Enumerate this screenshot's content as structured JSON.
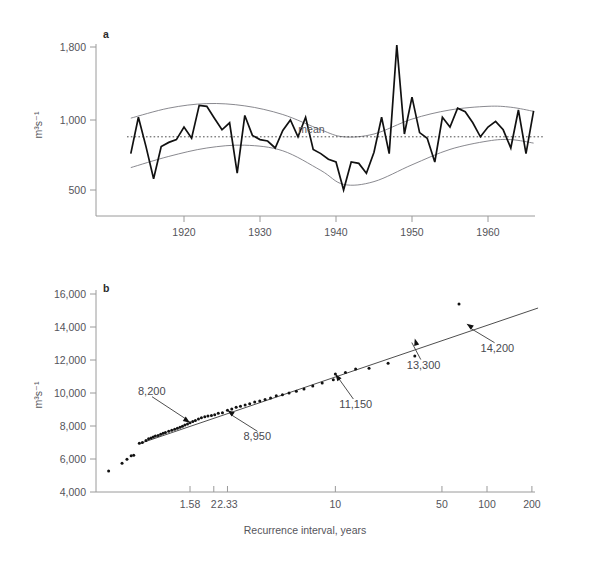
{
  "figure": {
    "panel_a_letter": "a",
    "panel_b_letter": "b"
  },
  "chart_data": [
    {
      "type": "line",
      "panel": "a",
      "title": "",
      "xlabel": "",
      "ylabel": "m3s-1",
      "ylabel_display": "m³s⁻¹",
      "xlim": [
        1912,
        1967
      ],
      "ylim": [
        330,
        1880
      ],
      "yticks": [
        500,
        1000,
        1800
      ],
      "ytick_labels": [
        "500",
        "1,000",
        "1,800"
      ],
      "xticks": [
        1920,
        1930,
        1940,
        1950,
        1960
      ],
      "xtick_labels": [
        "1920",
        "1930",
        "1940",
        "1950",
        "1960"
      ],
      "grid": false,
      "y_axis_scale": "non-linear-breaks",
      "annotations": [
        {
          "text": "mean",
          "x": 1938.5,
          "y": 880
        }
      ],
      "mean_value": 880,
      "series": [
        {
          "name": "annual discharge",
          "x": [
            1913,
            1914,
            1915,
            1916,
            1917,
            1918,
            1919,
            1920,
            1921,
            1922,
            1923,
            1924,
            1925,
            1926,
            1927,
            1928,
            1929,
            1930,
            1931,
            1932,
            1933,
            1934,
            1935,
            1936,
            1937,
            1938,
            1939,
            1940,
            1941,
            1942,
            1943,
            1944,
            1945,
            1946,
            1947,
            1948,
            1949,
            1950,
            1951,
            1952,
            1953,
            1954,
            1955,
            1956,
            1957,
            1958,
            1959,
            1960,
            1961,
            1962,
            1963,
            1964,
            1965,
            1966
          ],
          "values": [
            760,
            1030,
            810,
            580,
            810,
            840,
            860,
            950,
            870,
            1160,
            1150,
            1020,
            930,
            980,
            620,
            1050,
            890,
            860,
            850,
            800,
            925,
            1000,
            880,
            1030,
            790,
            760,
            720,
            700,
            500,
            700,
            690,
            620,
            770,
            1030,
            760,
            1820,
            900,
            1250,
            910,
            870,
            700,
            1030,
            950,
            1130,
            1090,
            980,
            880,
            950,
            990,
            930,
            800,
            1110,
            760,
            1100
          ]
        },
        {
          "name": "upper envelope",
          "x": [
            1913,
            1918,
            1923,
            1928,
            1933,
            1938,
            1941,
            1945,
            1950,
            1955,
            1960,
            1963,
            1966
          ],
          "values": [
            1020,
            1130,
            1180,
            1155,
            1060,
            930,
            880,
            900,
            1010,
            1110,
            1150,
            1140,
            1095
          ]
        },
        {
          "name": "lower envelope",
          "x": [
            1913,
            1918,
            1923,
            1928,
            1933,
            1938,
            1941,
            1945,
            1950,
            1955,
            1960,
            1963,
            1966
          ],
          "values": [
            660,
            740,
            800,
            820,
            780,
            640,
            540,
            560,
            680,
            790,
            850,
            860,
            835
          ]
        }
      ]
    },
    {
      "type": "scatter",
      "panel": "b",
      "title": "",
      "xlabel": "Recurrence interval, years",
      "ylabel": "m3s-1",
      "ylabel_display": "m³s⁻¹",
      "x_axis_scale": "log-gumbel",
      "ylim": [
        4000,
        16000
      ],
      "yticks": [
        4000,
        6000,
        8000,
        10000,
        12000,
        14000,
        16000
      ],
      "ytick_labels": [
        "4,000",
        "6,000",
        "8,000",
        "10,000",
        "12,000",
        "14,000",
        "16,000"
      ],
      "xticks": [
        1.58,
        2,
        2.33,
        10,
        50,
        100,
        200
      ],
      "xtick_labels": [
        "1.58",
        "2",
        "2.33",
        "10",
        "50",
        "100",
        "200"
      ],
      "grid": false,
      "fit_line": {
        "name": "Gumbel fit",
        "x_start": 1.13,
        "y_start": 6950,
        "x_end": 220,
        "y_end": 15150
      },
      "annotations": [
        {
          "text": "8,200",
          "value": 8200,
          "point_x": 1.58,
          "point_y": 8200
        },
        {
          "text": "8,950",
          "value": 8950,
          "point_x": 2.33,
          "point_y": 8950
        },
        {
          "text": "11,150",
          "value": 11150,
          "point_x": 10,
          "point_y": 11150
        },
        {
          "text": "13,300",
          "value": 13300,
          "point_x": 33,
          "point_y": 13300
        },
        {
          "text": "14,200",
          "value": 14200,
          "point_x": 73,
          "point_y": 14200
        }
      ],
      "points": [
        {
          "x": 1.03,
          "y": 5280
        },
        {
          "x": 1.06,
          "y": 5750
        },
        {
          "x": 1.075,
          "y": 5990
        },
        {
          "x": 1.09,
          "y": 6190
        },
        {
          "x": 1.1,
          "y": 6230
        },
        {
          "x": 1.125,
          "y": 6960
        },
        {
          "x": 1.14,
          "y": 7000
        },
        {
          "x": 1.16,
          "y": 7120
        },
        {
          "x": 1.175,
          "y": 7220
        },
        {
          "x": 1.19,
          "y": 7280
        },
        {
          "x": 1.205,
          "y": 7330
        },
        {
          "x": 1.22,
          "y": 7390
        },
        {
          "x": 1.24,
          "y": 7430
        },
        {
          "x": 1.26,
          "y": 7500
        },
        {
          "x": 1.28,
          "y": 7560
        },
        {
          "x": 1.3,
          "y": 7610
        },
        {
          "x": 1.33,
          "y": 7680
        },
        {
          "x": 1.36,
          "y": 7740
        },
        {
          "x": 1.39,
          "y": 7800
        },
        {
          "x": 1.42,
          "y": 7870
        },
        {
          "x": 1.45,
          "y": 7930
        },
        {
          "x": 1.48,
          "y": 7990
        },
        {
          "x": 1.51,
          "y": 8060
        },
        {
          "x": 1.545,
          "y": 8120
        },
        {
          "x": 1.58,
          "y": 8200
        },
        {
          "x": 1.62,
          "y": 8270
        },
        {
          "x": 1.66,
          "y": 8340
        },
        {
          "x": 1.71,
          "y": 8430
        },
        {
          "x": 1.76,
          "y": 8500
        },
        {
          "x": 1.82,
          "y": 8560
        },
        {
          "x": 1.88,
          "y": 8600
        },
        {
          "x": 1.95,
          "y": 8640
        },
        {
          "x": 2.02,
          "y": 8680
        },
        {
          "x": 2.1,
          "y": 8780
        },
        {
          "x": 2.2,
          "y": 8800
        },
        {
          "x": 2.33,
          "y": 8950
        },
        {
          "x": 2.45,
          "y": 9030
        },
        {
          "x": 2.58,
          "y": 9130
        },
        {
          "x": 2.72,
          "y": 9200
        },
        {
          "x": 2.88,
          "y": 9280
        },
        {
          "x": 3.05,
          "y": 9350
        },
        {
          "x": 3.25,
          "y": 9450
        },
        {
          "x": 3.47,
          "y": 9520
        },
        {
          "x": 3.72,
          "y": 9600
        },
        {
          "x": 4.0,
          "y": 9700
        },
        {
          "x": 4.32,
          "y": 9830
        },
        {
          "x": 4.7,
          "y": 9900
        },
        {
          "x": 5.15,
          "y": 10000
        },
        {
          "x": 5.7,
          "y": 10100
        },
        {
          "x": 6.35,
          "y": 10250
        },
        {
          "x": 7.2,
          "y": 10420
        },
        {
          "x": 8.25,
          "y": 10600
        },
        {
          "x": 9.7,
          "y": 10800
        },
        {
          "x": 10.0,
          "y": 11150
        },
        {
          "x": 11.6,
          "y": 11250
        },
        {
          "x": 13.5,
          "y": 11450
        },
        {
          "x": 16.5,
          "y": 11500
        },
        {
          "x": 22.0,
          "y": 11800
        },
        {
          "x": 33.0,
          "y": 12250
        },
        {
          "x": 65.0,
          "y": 15400
        }
      ]
    }
  ]
}
